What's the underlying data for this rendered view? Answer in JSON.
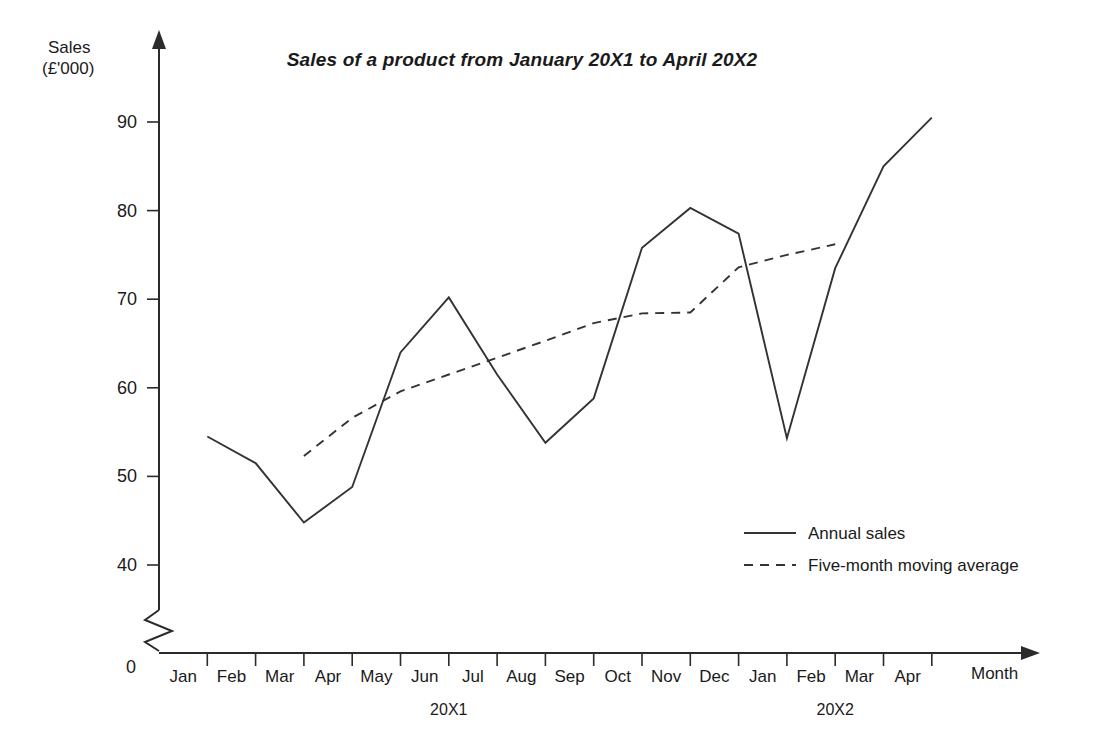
{
  "chart_data": {
    "type": "line",
    "title": "Sales of a product from January 20X1 to April 20X2",
    "xlabel": "Month",
    "ylabel": "Sales\n(£'000)",
    "ylabel_line1": "Sales",
    "ylabel_line2": "(£'000)",
    "grid": false,
    "legend_position": "inside-bottom-right",
    "axis_break": true,
    "ylim": [
      0,
      95
    ],
    "y_visible_min": 37,
    "y_ticks": [
      40,
      50,
      60,
      70,
      80,
      90
    ],
    "y_tick_labels": [
      "40",
      "50",
      "60",
      "70",
      "80",
      "90"
    ],
    "origin_label": "0",
    "categories": [
      "Jan",
      "Feb",
      "Mar",
      "Apr",
      "May",
      "Jun",
      "Jul",
      "Aug",
      "Sep",
      "Oct",
      "Nov",
      "Dec",
      "Jan",
      "Feb",
      "Mar",
      "Apr"
    ],
    "group_labels": [
      {
        "label": "20X1",
        "start_index": 0,
        "end_index": 11
      },
      {
        "label": "20X2",
        "start_index": 12,
        "end_index": 15
      }
    ],
    "series": [
      {
        "name": "Annual sales",
        "style": "solid",
        "values": [
          54.5,
          51.5,
          44.8,
          48.8,
          64.0,
          70.2,
          61.5,
          53.8,
          58.8,
          75.8,
          80.3,
          77.4,
          54.3,
          73.5,
          85.0,
          90.5
        ]
      },
      {
        "name": "Five-month moving average",
        "style": "dashed",
        "values": [
          null,
          null,
          52.3,
          56.6,
          59.6,
          61.5,
          63.4,
          65.3,
          67.3,
          68.4,
          68.5,
          73.6,
          75.0,
          76.2,
          null,
          null
        ]
      }
    ],
    "legend": [
      {
        "label": "Annual sales",
        "style": "solid"
      },
      {
        "label": "Five-month moving average",
        "style": "dashed"
      }
    ]
  }
}
